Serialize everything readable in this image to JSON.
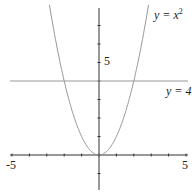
{
  "chart_data": {
    "type": "line",
    "title": "",
    "xlabel": "",
    "ylabel": "",
    "xlim": [
      -5,
      5
    ],
    "ylim": [
      -2,
      8
    ],
    "grid": false,
    "x_ticks": [
      -5,
      -4,
      -3,
      -2,
      -1,
      0,
      1,
      2,
      3,
      4,
      5
    ],
    "x_tick_labels": [
      "-5",
      "5"
    ],
    "y_tick_labels": [
      "5"
    ],
    "series": [
      {
        "name": "y = x^2",
        "label": "y = x",
        "exponent": "2",
        "function": "x^2",
        "color": "#888888",
        "x": [
          -2.83,
          -2,
          -1,
          0,
          1,
          2,
          2.83
        ],
        "y": [
          8,
          4,
          1,
          0,
          1,
          4,
          8
        ]
      },
      {
        "name": "y = 4",
        "label": "y = 4",
        "function": "4",
        "color": "#888888",
        "x": [
          -5,
          5
        ],
        "y": [
          4,
          4
        ]
      }
    ]
  }
}
